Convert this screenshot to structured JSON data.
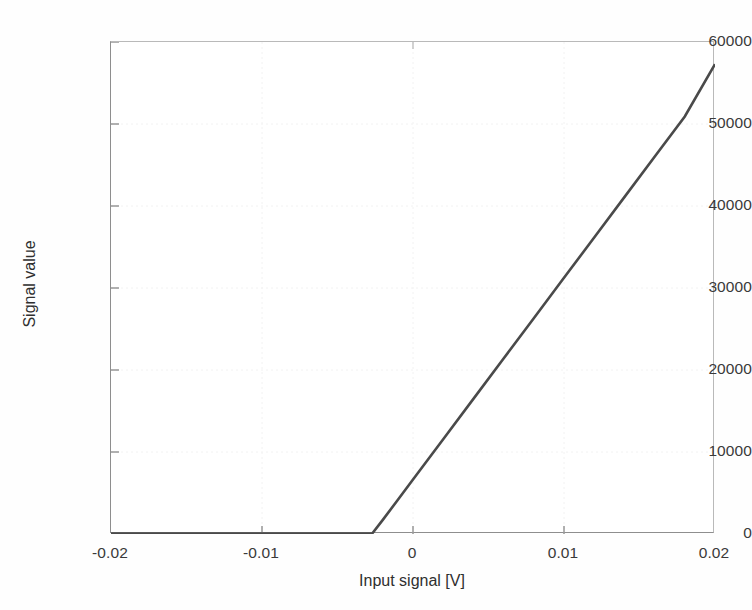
{
  "chart": {
    "title": "",
    "xlabel": "Input signal [V]",
    "ylabel": "Signal value"
  },
  "chart_data": {
    "type": "line",
    "title": "",
    "xlabel": "Input signal [V]",
    "ylabel": "Signal value",
    "xlim": [
      -0.02,
      0.02
    ],
    "ylim": [
      0,
      60000
    ],
    "xticks": [
      -0.02,
      -0.01,
      0,
      0.01,
      0.02
    ],
    "xtick_labels": [
      "-0.02",
      "-0.01",
      "0",
      "0.01",
      "0.02"
    ],
    "yticks": [
      0,
      10000,
      20000,
      30000,
      40000,
      50000,
      60000
    ],
    "ytick_labels": [
      "0",
      "10000",
      "20000",
      "30000",
      "40000",
      "50000",
      "60000"
    ],
    "grid": false,
    "legend": null,
    "line_color": "#4a4a4a",
    "line_width": 2.6,
    "series": [
      {
        "name": "Signal value",
        "x": [
          -0.02,
          -0.019,
          -0.018,
          -0.017,
          -0.016,
          -0.015,
          -0.014,
          -0.013,
          -0.012,
          -0.011,
          -0.01,
          -0.009,
          -0.008,
          -0.007,
          -0.006,
          -0.005,
          -0.004,
          -0.003,
          -0.0027,
          -0.002,
          -0.001,
          0,
          0.002,
          0.004,
          0.006,
          0.008,
          0.01,
          0.012,
          0.014,
          0.016,
          0.018,
          0.02
        ],
        "y": [
          0,
          0,
          0,
          0,
          0,
          0,
          0,
          0,
          0,
          0,
          0,
          0,
          0,
          0,
          0,
          0,
          0,
          0,
          0,
          1720,
          4180,
          6640,
          11560,
          16480,
          21400,
          26320,
          31240,
          36160,
          41080,
          46000,
          50920,
          57300
        ]
      }
    ],
    "knee_point": {
      "x": -0.0027,
      "y": 0
    },
    "end_point": {
      "x": 0.02,
      "y": 57300
    },
    "slope_per_volt": 2460000
  },
  "ticks": {
    "y": [
      {
        "label": "60000",
        "top": 33
      },
      {
        "label": "50000",
        "top": 115
      },
      {
        "label": "40000",
        "top": 197
      },
      {
        "label": "30000",
        "top": 279
      },
      {
        "label": "20000",
        "top": 361
      },
      {
        "label": "10000",
        "top": 443
      },
      {
        "label": "0",
        "top": 525
      }
    ],
    "x": [
      {
        "label": "-0.02",
        "left": 50
      },
      {
        "label": "-0.01",
        "left": 201
      },
      {
        "label": "0",
        "left": 352
      },
      {
        "label": "0.01",
        "left": 503
      },
      {
        "label": "0.02",
        "left": 654
      }
    ]
  }
}
